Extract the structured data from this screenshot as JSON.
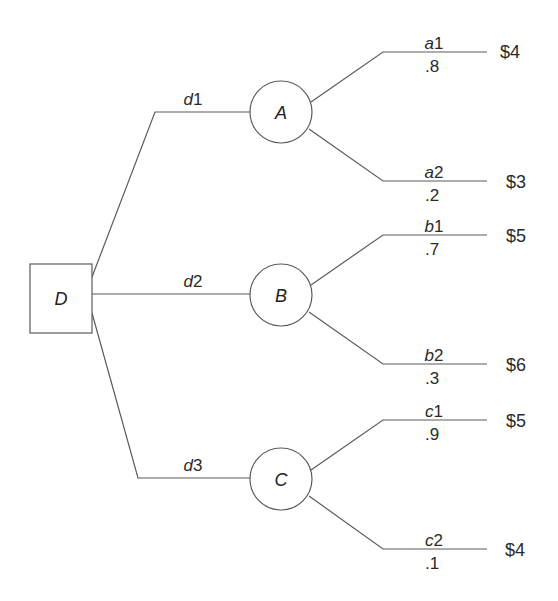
{
  "diagram": {
    "type": "decision-tree",
    "decision_node": {
      "id": "D",
      "label": "D"
    },
    "decision_branches": [
      {
        "id": "d1",
        "var": "d",
        "index": "1",
        "to": "A"
      },
      {
        "id": "d2",
        "var": "d",
        "index": "2",
        "to": "B"
      },
      {
        "id": "d3",
        "var": "d",
        "index": "3",
        "to": "C"
      }
    ],
    "chance_nodes": [
      {
        "id": "A",
        "label": "A",
        "outcomes": [
          {
            "var": "a",
            "index": "1",
            "probability": ".8",
            "payoff": "$4"
          },
          {
            "var": "a",
            "index": "2",
            "probability": ".2",
            "payoff": "$3"
          }
        ]
      },
      {
        "id": "B",
        "label": "B",
        "outcomes": [
          {
            "var": "b",
            "index": "1",
            "probability": ".7",
            "payoff": "$5"
          },
          {
            "var": "b",
            "index": "2",
            "probability": ".3",
            "payoff": "$6"
          }
        ]
      },
      {
        "id": "C",
        "label": "C",
        "outcomes": [
          {
            "var": "c",
            "index": "1",
            "probability": ".9",
            "payoff": "$5"
          },
          {
            "var": "c",
            "index": "2",
            "probability": ".1",
            "payoff": "$4"
          }
        ]
      }
    ]
  }
}
